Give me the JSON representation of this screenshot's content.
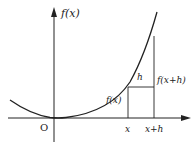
{
  "diagram": {
    "type": "function-graph",
    "colors": {
      "stroke": "#222222",
      "background": "#ffffff"
    },
    "labels": {
      "y_axis": "f(x)",
      "origin": "O",
      "x_tick_1": "x",
      "x_tick_2": "x+h",
      "segment_fx": "f(x)",
      "segment_fxh": "f(x+h)",
      "increment": "h"
    }
  }
}
